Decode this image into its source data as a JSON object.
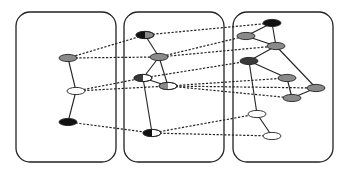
{
  "diagram": {
    "title": "",
    "colors": {
      "black": "#111111",
      "dark": "#3a3a3a",
      "gray": "#8a8a8a",
      "white": "#ffffff",
      "stroke": "#222222"
    },
    "panels": [
      {
        "id": "panel-1",
        "x": 16,
        "y": 12,
        "w": 100,
        "h": 150
      },
      {
        "id": "panel-2",
        "x": 124,
        "y": 12,
        "w": 100,
        "h": 150
      },
      {
        "id": "panel-3",
        "x": 233,
        "y": 12,
        "w": 100,
        "h": 150
      }
    ],
    "nodes": [
      {
        "id": "L1",
        "panel": 1,
        "x": 68,
        "y": 58,
        "fill": "gray"
      },
      {
        "id": "L2",
        "panel": 1,
        "x": 76,
        "y": 91,
        "fill": "white"
      },
      {
        "id": "L3",
        "panel": 1,
        "x": 68,
        "y": 122,
        "fill": "black"
      },
      {
        "id": "C1",
        "panel": 2,
        "x": 145,
        "y": 35,
        "fill": "gray",
        "half": "black"
      },
      {
        "id": "C2",
        "panel": 2,
        "x": 159,
        "y": 57,
        "fill": "gray"
      },
      {
        "id": "C3",
        "panel": 2,
        "x": 143,
        "y": 78,
        "fill": "white",
        "half": "dark"
      },
      {
        "id": "C4",
        "panel": 2,
        "x": 168,
        "y": 86,
        "fill": "white",
        "half": "gray"
      },
      {
        "id": "C5",
        "panel": 2,
        "x": 152,
        "y": 133,
        "fill": "white",
        "half": "black"
      },
      {
        "id": "R1",
        "panel": 3,
        "x": 272,
        "y": 23,
        "fill": "black"
      },
      {
        "id": "R2",
        "panel": 3,
        "x": 246,
        "y": 36,
        "fill": "gray"
      },
      {
        "id": "R3",
        "panel": 3,
        "x": 276,
        "y": 46,
        "fill": "gray"
      },
      {
        "id": "R4",
        "panel": 3,
        "x": 249,
        "y": 61,
        "fill": "dark"
      },
      {
        "id": "R5",
        "panel": 3,
        "x": 287,
        "y": 78,
        "fill": "gray"
      },
      {
        "id": "R6",
        "panel": 3,
        "x": 316,
        "y": 88,
        "fill": "gray"
      },
      {
        "id": "R7",
        "panel": 3,
        "x": 292,
        "y": 98,
        "fill": "gray"
      },
      {
        "id": "R8",
        "panel": 3,
        "x": 257,
        "y": 114,
        "fill": "white"
      },
      {
        "id": "R9",
        "panel": 3,
        "x": 272,
        "y": 136,
        "fill": "white"
      }
    ],
    "solid_edges": [
      [
        "L1",
        "L2"
      ],
      [
        "L2",
        "L3"
      ],
      [
        "C1",
        "C2"
      ],
      [
        "C2",
        "C3"
      ],
      [
        "C2",
        "C4"
      ],
      [
        "C3",
        "C4"
      ],
      [
        "C3",
        "C5"
      ],
      [
        "R1",
        "R2"
      ],
      [
        "R1",
        "R3"
      ],
      [
        "R2",
        "R3"
      ],
      [
        "R3",
        "R6"
      ],
      [
        "R4",
        "R3"
      ],
      [
        "R4",
        "R5"
      ],
      [
        "R4",
        "R8"
      ],
      [
        "R5",
        "R7"
      ],
      [
        "R7",
        "R6"
      ],
      [
        "R8",
        "R9"
      ]
    ],
    "dashed_edges": [
      [
        "L1",
        "C1"
      ],
      [
        "L1",
        "C2"
      ],
      [
        "L2",
        "C3"
      ],
      [
        "L2",
        "C4"
      ],
      [
        "L3",
        "C5"
      ],
      [
        "C1",
        "R1"
      ],
      [
        "C2",
        "R2"
      ],
      [
        "C2",
        "R3"
      ],
      [
        "C3",
        "R4"
      ],
      [
        "C4",
        "R5"
      ],
      [
        "C4",
        "R6"
      ],
      [
        "C4",
        "R7"
      ],
      [
        "C5",
        "R8"
      ],
      [
        "C5",
        "R9"
      ]
    ]
  }
}
